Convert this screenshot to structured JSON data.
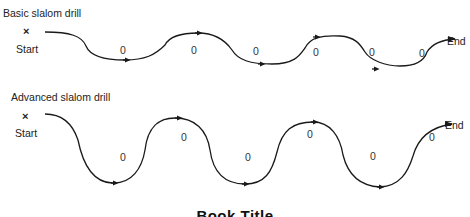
{
  "basic": {
    "title": "Basic slalom drill",
    "start_mark": "×",
    "start_label": "Start",
    "end_label": "End",
    "cones": [
      "0",
      "0",
      "0",
      "0",
      "0",
      "0"
    ]
  },
  "advanced": {
    "title": "Advanced slalom drill",
    "start_mark": "×",
    "start_label": "Start",
    "end_label": "End",
    "cones": [
      "0",
      "0",
      "0",
      "0",
      "0",
      "0"
    ]
  },
  "caption": "Book Title",
  "colors": {
    "stroke": "#1a1a1a",
    "text": "#222222"
  }
}
